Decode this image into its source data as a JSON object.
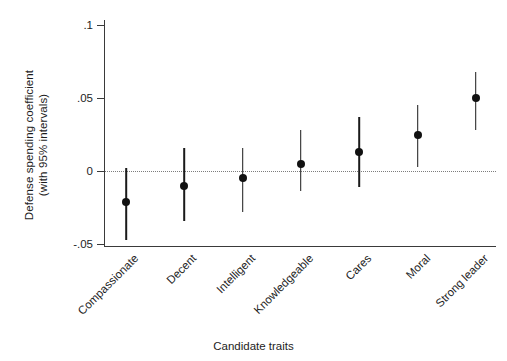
{
  "chart_data": {
    "type": "scatter",
    "title": "",
    "xlabel": "Candidate traits",
    "ylabel": "Defense spending coefficient\n(with 95% intervals)",
    "categories": [
      "Compassionate",
      "Decent",
      "Intelligent",
      "Knowledgeable",
      "Cares",
      "Moral",
      "Strong leader"
    ],
    "values": [
      -0.021,
      -0.01,
      -0.005,
      0.005,
      0.013,
      0.025,
      0.05
    ],
    "ci_low": [
      -0.047,
      -0.034,
      -0.028,
      -0.014,
      -0.011,
      0.003,
      0.028
    ],
    "ci_high": [
      0.002,
      0.016,
      0.016,
      0.028,
      0.037,
      0.045,
      0.068
    ],
    "ylim": [
      -0.05,
      0.105
    ],
    "yticks": [
      0.1,
      0.05,
      0,
      -0.05
    ],
    "ytick_labels": [
      ".1",
      ".05",
      "0",
      "-.05"
    ],
    "grid": false,
    "reference_line": 0,
    "legend": "none",
    "marker_color": "#111111",
    "line_color": "#1a1a1a",
    "axis_color": "#3a3a3a",
    "zero_line_color": "#7d7d7d"
  },
  "axes": {
    "y_title": "Defense spending coefficient\n(with 95% intervals)",
    "x_title": "Candidate traits"
  },
  "yticks": [
    {
      "label": ".1"
    },
    {
      "label": ".05"
    },
    {
      "label": "0"
    },
    {
      "label": "-.05"
    }
  ],
  "points": [
    {
      "label": "Compassionate"
    },
    {
      "label": "Decent"
    },
    {
      "label": "Intelligent"
    },
    {
      "label": "Knowledgeable"
    },
    {
      "label": "Cares"
    },
    {
      "label": "Moral"
    },
    {
      "label": "Strong leader"
    }
  ]
}
